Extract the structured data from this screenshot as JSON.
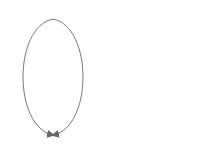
{
  "diagrams": [
    {
      "start": {
        "numerator": "2",
        "denominator": "3"
      },
      "end": {
        "numerator": "16",
        "denominator": "24"
      },
      "left_operation": "× 8",
      "right_operation": "× 8",
      "equals": "="
    },
    {
      "start": {
        "numerator": "1",
        "denominator": "2"
      },
      "end": {
        "numerator": "2",
        "denominator": "4"
      },
      "left_operation": "× 2",
      "right_operation": "× 2",
      "equals": "="
    }
  ],
  "colors": {
    "stroke": "#777777",
    "text": "#555555"
  }
}
